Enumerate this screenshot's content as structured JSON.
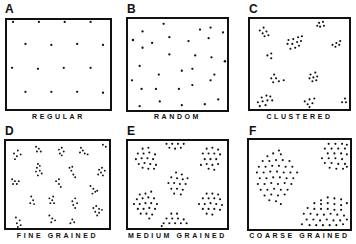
{
  "figure": {
    "panels": [
      {
        "id": "A",
        "letter": "A",
        "caption": "REGULAR"
      },
      {
        "id": "B",
        "letter": "B",
        "caption": "RANDOM"
      },
      {
        "id": "C",
        "letter": "C",
        "caption": "CLUSTERED"
      },
      {
        "id": "D",
        "letter": "D",
        "caption": "FINE GRAINED"
      },
      {
        "id": "E",
        "letter": "E",
        "caption": "MEDIUM GRAINED"
      },
      {
        "id": "F",
        "letter": "F",
        "caption": "COARSE GRAINED"
      }
    ],
    "colors": {
      "ink": "#111111",
      "background": "#ffffff"
    }
  }
}
